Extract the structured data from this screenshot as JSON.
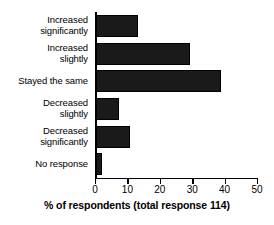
{
  "chart_data": {
    "type": "bar",
    "orientation": "horizontal",
    "title": "",
    "xlabel": "% of respondents (total response 114)",
    "ylabel": "",
    "xlim": [
      0,
      50
    ],
    "xticks": [
      0,
      10,
      20,
      30,
      40,
      50
    ],
    "xtick_labels": [
      "0",
      "10",
      "20",
      "30",
      "40",
      "50"
    ],
    "grid": false,
    "legend": false,
    "bar_color": "#1a1a1a",
    "background_color": "#ffffff",
    "total_responses": 114,
    "categories": [
      "Increased significantly",
      "Increased slightly",
      "Stayed the same",
      "Decreased slightly",
      "Decreased significantly",
      "No response"
    ],
    "category_lines": [
      [
        "Increased",
        "significantly"
      ],
      [
        "Increased",
        "slightly"
      ],
      [
        "Stayed the same"
      ],
      [
        "Decreased",
        "slightly"
      ],
      [
        "Decreased",
        "significantly"
      ],
      [
        "No response"
      ]
    ],
    "values": [
      13,
      29,
      38.5,
      7,
      10.5,
      2
    ]
  }
}
